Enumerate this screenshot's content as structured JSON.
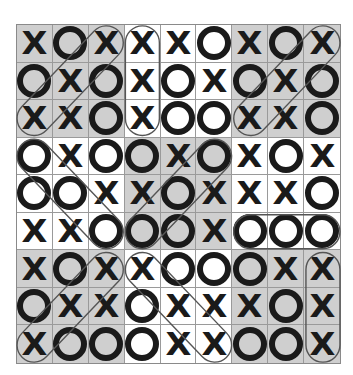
{
  "board": {
    "rows": [
      [
        "X",
        "O",
        "X",
        "X",
        "X",
        "O",
        "X",
        "O",
        "X"
      ],
      [
        "O",
        "X",
        "O",
        "X",
        "O",
        "X",
        "O",
        "X",
        "O"
      ],
      [
        "X",
        "X",
        "O",
        "X",
        "O",
        "O",
        "X",
        "X",
        "O"
      ],
      [
        "O",
        "X",
        "O",
        "O",
        "X",
        "O",
        "X",
        "O",
        "X"
      ],
      [
        "O",
        "O",
        "X",
        "X",
        "O",
        "X",
        "X",
        "X",
        "O"
      ],
      [
        "X",
        "X",
        "O",
        "O",
        "O",
        "X",
        "O",
        "O",
        "O"
      ],
      [
        "X",
        "O",
        "X",
        "X",
        "O",
        "O",
        "O",
        "X",
        "X"
      ],
      [
        "O",
        "X",
        "X",
        "O",
        "X",
        "X",
        "X",
        "O",
        "X"
      ],
      [
        "X",
        "O",
        "O",
        "O",
        "X",
        "X",
        "O",
        "O",
        "X"
      ]
    ],
    "shaded_blocks": [
      [
        0,
        0
      ],
      [
        0,
        2
      ],
      [
        1,
        1
      ],
      [
        2,
        0
      ],
      [
        2,
        2
      ]
    ],
    "colors": {
      "shade": "#cfcfcf",
      "light": "#ffffff",
      "mark": "#1a1a1a",
      "grid": "#9a9a9a"
    },
    "winning_lines": [
      {
        "symbol": "X",
        "cells": [
          [
            0,
            2
          ],
          [
            1,
            1
          ],
          [
            2,
            0
          ]
        ]
      },
      {
        "symbol": "X",
        "cells": [
          [
            0,
            3
          ],
          [
            1,
            3
          ],
          [
            2,
            3
          ]
        ]
      },
      {
        "symbol": "X",
        "cells": [
          [
            0,
            8
          ],
          [
            1,
            7
          ],
          [
            2,
            6
          ]
        ]
      },
      {
        "symbol": "O",
        "cells": [
          [
            3,
            0
          ],
          [
            4,
            1
          ],
          [
            5,
            2
          ]
        ]
      },
      {
        "symbol": "O",
        "cells": [
          [
            3,
            5
          ],
          [
            4,
            4
          ],
          [
            5,
            3
          ]
        ]
      },
      {
        "symbol": "O",
        "cells": [
          [
            5,
            6
          ],
          [
            5,
            7
          ],
          [
            5,
            8
          ]
        ]
      },
      {
        "symbol": "X",
        "cells": [
          [
            6,
            2
          ],
          [
            7,
            1
          ],
          [
            8,
            0
          ]
        ]
      },
      {
        "symbol": "X",
        "cells": [
          [
            6,
            3
          ],
          [
            7,
            4
          ],
          [
            8,
            5
          ]
        ]
      },
      {
        "symbol": "X",
        "cells": [
          [
            6,
            8
          ],
          [
            7,
            8
          ],
          [
            8,
            8
          ]
        ]
      }
    ]
  }
}
